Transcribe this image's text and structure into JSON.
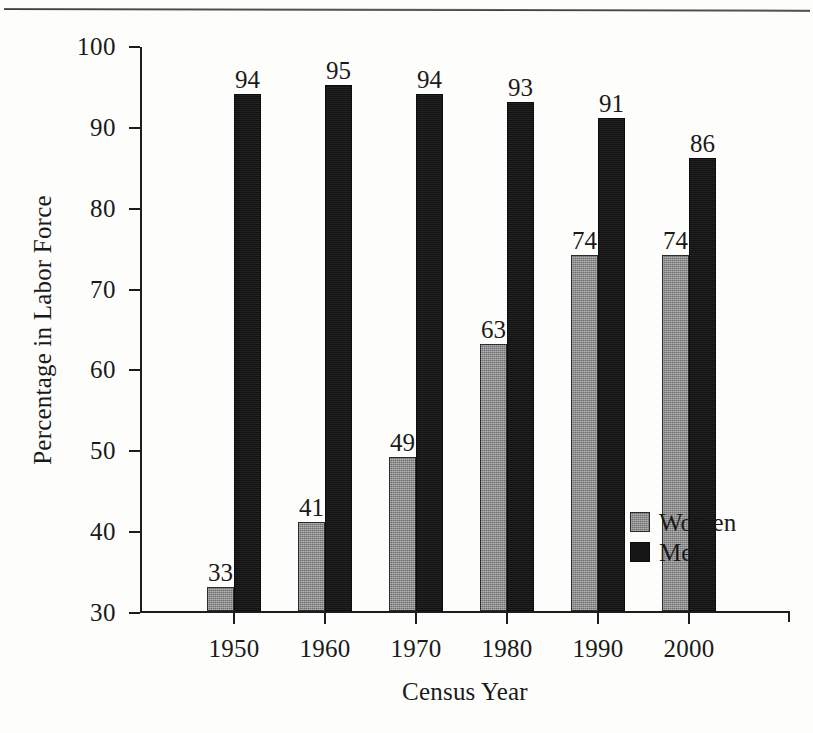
{
  "figure": {
    "background_color": "#fdfdfc",
    "has_top_rule": true
  },
  "chart_data": {
    "type": "bar",
    "title": "",
    "subtitle": "",
    "xlabel": "Census Year",
    "ylabel": "Percentage in Labor Force",
    "categories": [
      "1950",
      "1960",
      "1970",
      "1980",
      "1990",
      "2000"
    ],
    "series": [
      {
        "name": "Women",
        "color": "#8d8d8d",
        "values": [
          33,
          41,
          49,
          63,
          74,
          74
        ]
      },
      {
        "name": "Men",
        "color": "#161616",
        "values": [
          94,
          95,
          94,
          93,
          91,
          86
        ]
      }
    ],
    "ylim": [
      30,
      100
    ],
    "yticks": [
      30,
      40,
      50,
      60,
      70,
      80,
      90,
      100
    ],
    "ytick_labels": [
      "30",
      "40",
      "50",
      "60",
      "70",
      "80",
      "90",
      "100"
    ],
    "grid": false,
    "legend_position": "inside-lower-right",
    "value_labels_shown": true,
    "value_labels": {
      "women": [
        "33",
        "41",
        "49",
        "63",
        "74",
        "74"
      ],
      "men": [
        "94",
        "95",
        "94",
        "93",
        "91",
        "86"
      ]
    }
  },
  "legend": {
    "entries": [
      {
        "label": "Women",
        "swatch": "gray-swatch"
      },
      {
        "label": "Men",
        "swatch": "black-swatch"
      }
    ]
  }
}
